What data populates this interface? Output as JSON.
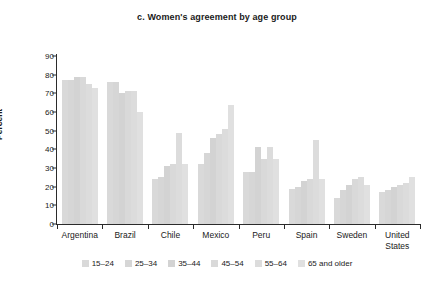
{
  "chart_data": {
    "type": "bar",
    "title": "c. Women's agreement by age group",
    "xlabel": "",
    "ylabel": "Percent",
    "ylim": [
      0,
      90
    ],
    "yticks": [
      0,
      10,
      20,
      30,
      40,
      50,
      60,
      70,
      80,
      90
    ],
    "grid": false,
    "legend_position": "bottom",
    "categories": [
      "Argentina",
      "Brazil",
      "Chile",
      "Mexico",
      "Peru",
      "Spain",
      "Sweden",
      "United States"
    ],
    "series": [
      {
        "name": "15–24",
        "color": "#d9d9d9",
        "values": [
          77,
          76,
          24,
          32,
          28,
          19,
          14,
          17
        ]
      },
      {
        "name": "25–34",
        "color": "#d6d6d6",
        "values": [
          77,
          76,
          25,
          38,
          28,
          20,
          18,
          18
        ]
      },
      {
        "name": "35–44",
        "color": "#d3d3d3",
        "values": [
          79,
          70,
          31,
          46,
          41,
          23,
          21,
          20
        ]
      },
      {
        "name": "45–54",
        "color": "#d9d9d9",
        "values": [
          79,
          71,
          32,
          48,
          35,
          24,
          24,
          21
        ]
      },
      {
        "name": "55–64",
        "color": "#dcdcdc",
        "values": [
          75,
          71,
          49,
          51,
          41,
          45,
          25,
          22
        ]
      },
      {
        "name": "65 and older",
        "color": "#e0e0e0",
        "values": [
          73,
          60,
          32,
          64,
          35,
          24,
          21,
          25
        ]
      }
    ]
  }
}
